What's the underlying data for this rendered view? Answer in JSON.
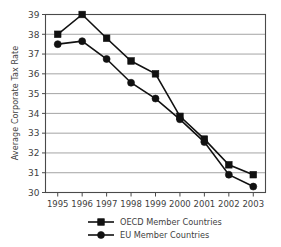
{
  "chart_data": {
    "type": "line",
    "title": "",
    "xlabel": "",
    "ylabel": "Average Corporate Tax Rate",
    "categories": [
      "1995",
      "1996",
      "1997",
      "1998",
      "1999",
      "2000",
      "2001",
      "2002",
      "2003"
    ],
    "ylim": [
      30,
      39
    ],
    "ytick_labels": [
      "30",
      "31",
      "32",
      "33",
      "34",
      "35",
      "36",
      "37",
      "38",
      "39"
    ],
    "ytick_values": [
      30,
      31,
      32,
      33,
      34,
      35,
      36,
      37,
      38,
      39
    ],
    "grid": true,
    "legend_position": "bottom",
    "series": [
      {
        "name": "OECD Member Countries",
        "marker": "square",
        "color": "#111111",
        "values": [
          38.0,
          39.0,
          37.8,
          36.65,
          36.0,
          33.85,
          32.7,
          31.4,
          30.9
        ]
      },
      {
        "name": "EU Member Countries",
        "marker": "circle",
        "color": "#111111",
        "values": [
          37.5,
          37.65,
          36.75,
          35.55,
          34.75,
          33.7,
          32.55,
          30.9,
          30.3
        ]
      }
    ]
  },
  "axis": {
    "y_title": "Average Corporate Tax Rate"
  },
  "legend": {
    "items": [
      {
        "label": "OECD Member Countries",
        "marker": "square-marker-icon"
      },
      {
        "label": "EU Member Countries",
        "marker": "circle-marker-icon"
      }
    ]
  }
}
